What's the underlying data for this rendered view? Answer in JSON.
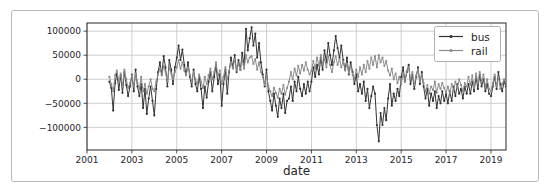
{
  "chart_data": {
    "type": "line",
    "title": "",
    "xlabel": "date",
    "ylabel": "",
    "grid": true,
    "legend_position": "upper right",
    "xlim": [
      2001,
      2019.67
    ],
    "ylim": [
      -147000,
      117000
    ],
    "x_start": 2002.0,
    "x_step": 0.0833333,
    "x_unit": "years (monthly samples)",
    "plot_area": {
      "left": 87,
      "top": 23,
      "width": 419,
      "height": 127
    },
    "xticks": [
      {
        "v": 2001,
        "label": "2001"
      },
      {
        "v": 2003,
        "label": "2003"
      },
      {
        "v": 2005,
        "label": "2005"
      },
      {
        "v": 2007,
        "label": "2007"
      },
      {
        "v": 2009,
        "label": "2009"
      },
      {
        "v": 2011,
        "label": "2011"
      },
      {
        "v": 2013,
        "label": "2013"
      },
      {
        "v": 2015,
        "label": "2015"
      },
      {
        "v": 2017,
        "label": "2017"
      },
      {
        "v": 2019,
        "label": "2019"
      }
    ],
    "yticks": [
      {
        "v": 100000,
        "label": "100000"
      },
      {
        "v": 50000,
        "label": "50000"
      },
      {
        "v": 0,
        "label": "0"
      },
      {
        "v": -50000,
        "label": "−50000"
      },
      {
        "v": -100000,
        "label": "−100000"
      }
    ],
    "colors": {
      "background": "#ffffff",
      "frame": "#b4babd",
      "axis": "#262626",
      "grid": "#c3c3c3",
      "legend_border": "#b0b0b0",
      "legend_fill": "#ffffff"
    },
    "series": [
      {
        "name": "bus",
        "color": "#333333",
        "marker": "dot",
        "values": [
          -5000,
          -18000,
          -65000,
          -8000,
          12000,
          -22000,
          8000,
          -28000,
          15000,
          -12000,
          -35000,
          -15000,
          10000,
          -25000,
          20000,
          -15000,
          -35000,
          -10000,
          -60000,
          -20000,
          -72000,
          -40000,
          -15000,
          -45000,
          -75000,
          -20000,
          15000,
          35000,
          10000,
          48000,
          25000,
          -15000,
          40000,
          20000,
          -10000,
          25000,
          45000,
          70000,
          40000,
          62000,
          30000,
          10000,
          35000,
          5000,
          -15000,
          20000,
          -10000,
          -25000,
          5000,
          -20000,
          -60000,
          -15000,
          -38000,
          -5000,
          15000,
          -25000,
          5000,
          30000,
          -10000,
          10000,
          -55000,
          -10000,
          20000,
          -30000,
          15000,
          45000,
          25000,
          50000,
          15000,
          40000,
          20000,
          55000,
          30000,
          105000,
          60000,
          85000,
          108000,
          70000,
          95000,
          45000,
          75000,
          35000,
          10000,
          -15000,
          20000,
          -25000,
          -45000,
          -65000,
          -30000,
          -55000,
          -78000,
          -40000,
          -60000,
          -30000,
          -70000,
          -45000,
          -40000,
          -15000,
          -45000,
          -5000,
          -25000,
          5000,
          -20000,
          -35000,
          -10000,
          -30000,
          -5000,
          -25000,
          -5000,
          25000,
          5000,
          30000,
          10000,
          45000,
          20000,
          60000,
          35000,
          75000,
          50000,
          30000,
          60000,
          90000,
          65000,
          45000,
          70000,
          40000,
          20000,
          45000,
          10000,
          35000,
          15000,
          -10000,
          10000,
          -25000,
          -10000,
          -30000,
          -5000,
          -45000,
          -20000,
          -60000,
          -35000,
          -15000,
          -30000,
          -95000,
          -129000,
          -70000,
          -95000,
          -60000,
          -85000,
          -40000,
          -10000,
          -55000,
          -30000,
          -45000,
          -20000,
          -35000,
          5000,
          25000,
          -5000,
          15000,
          30000,
          -10000,
          10000,
          -20000,
          5000,
          25000,
          -10000,
          15000,
          -15000,
          -40000,
          -20000,
          -55000,
          -30000,
          -45000,
          -25000,
          -60000,
          -35000,
          -50000,
          -25000,
          -45000,
          -30000,
          -50000,
          -25000,
          -45000,
          -15000,
          -35000,
          -10000,
          -30000,
          -20000,
          -40000,
          -15000,
          -30000,
          -10000,
          -30000,
          -5000,
          -25000,
          5000,
          -20000,
          10000,
          -15000,
          0,
          -25000,
          -10000,
          -30000,
          -35000,
          -15000,
          5000,
          -20000,
          15000,
          -10000,
          -25000,
          -5000,
          -15000
        ]
      },
      {
        "name": "rail",
        "color": "#8c8c8c",
        "marker": "dot",
        "values": [
          5000,
          -10000,
          -25000,
          8000,
          18000,
          -5000,
          12000,
          -15000,
          20000,
          0,
          -18000,
          -8000,
          8000,
          -15000,
          12000,
          -8000,
          -20000,
          5000,
          -25000,
          -10000,
          -30000,
          -15000,
          0,
          -20000,
          -25000,
          -5000,
          10000,
          22000,
          8000,
          28000,
          15000,
          -5000,
          25000,
          12000,
          0,
          15000,
          25000,
          40000,
          22000,
          35000,
          18000,
          8000,
          25000,
          10000,
          -5000,
          15000,
          0,
          -10000,
          10000,
          -5000,
          -18000,
          5000,
          -10000,
          8000,
          22000,
          0,
          15000,
          35000,
          8000,
          18000,
          -10000,
          5000,
          25000,
          0,
          18000,
          35000,
          22000,
          42000,
          18000,
          32000,
          20000,
          40000,
          22000,
          50000,
          35000,
          45000,
          48000,
          32000,
          42000,
          20000,
          35000,
          15000,
          5000,
          -12000,
          8000,
          -15000,
          -25000,
          -35000,
          -18000,
          -28000,
          -38000,
          -20000,
          -30000,
          -12000,
          -32000,
          -18000,
          -5000,
          15000,
          0,
          22000,
          8000,
          28000,
          12000,
          30000,
          18000,
          35000,
          20000,
          10000,
          18000,
          38000,
          22000,
          45000,
          28000,
          50000,
          32000,
          42000,
          25000,
          48000,
          30000,
          15000,
          35000,
          48000,
          30000,
          42000,
          25000,
          38000,
          18000,
          32000,
          12000,
          28000,
          10000,
          0,
          20000,
          5000,
          25000,
          10000,
          30000,
          15000,
          38000,
          22000,
          45000,
          30000,
          48000,
          25000,
          50000,
          35000,
          45000,
          28000,
          38000,
          18000,
          8000,
          22000,
          0,
          12000,
          -8000,
          5000,
          -10000,
          12000,
          -5000,
          18000,
          25000,
          0,
          15000,
          -12000,
          8000,
          20000,
          -5000,
          10000,
          -8000,
          -25000,
          -12000,
          -30000,
          -15000,
          -22000,
          -5000,
          -28000,
          -10000,
          -20000,
          -8000,
          -18000,
          -28000,
          -15000,
          -30000,
          -10000,
          -22000,
          -5000,
          -18000,
          0,
          -12000,
          -25000,
          -8000,
          -15000,
          5000,
          -12000,
          8000,
          -18000,
          12000,
          -8000,
          15000,
          -5000,
          10000,
          -15000,
          0,
          -20000,
          -25000,
          -8000,
          10000,
          -15000,
          5000,
          -20000,
          -10000,
          0,
          -12000
        ]
      }
    ]
  }
}
